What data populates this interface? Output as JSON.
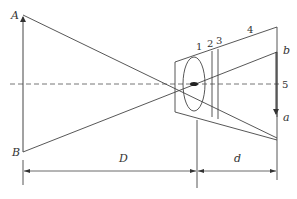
{
  "diagram": {
    "title": "",
    "colors": {
      "stroke": "#444444",
      "axis": "#666666",
      "background": "#ffffff"
    },
    "labels": {
      "A": "A",
      "B": "B",
      "a": "a",
      "b": "b",
      "D": "D",
      "d": "d",
      "n1": "1",
      "n2": "2",
      "n3": "3",
      "n4": "4",
      "n5": "5"
    },
    "elements": {
      "object": "object AB (upward arrow at left)",
      "lens": "lens 1 (ellipse)",
      "component2": "element 2 (vertical line)",
      "component3": "element 3 (vertical line)",
      "housing": "housing 4 (trapezoid)",
      "image_plane": "image plane 5 with image ba (downward arrow)",
      "optical_axis": "dashed optical axis",
      "dimension_D": "object distance D",
      "dimension_d": "image distance d"
    }
  }
}
